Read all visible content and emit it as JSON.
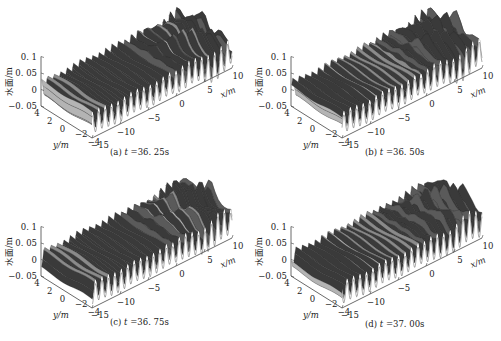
{
  "figure": {
    "panels": [
      {
        "id": "a",
        "letter": "(a)",
        "t_label": "t",
        "t_value": "=36. 25s",
        "left": 0,
        "top": 0,
        "seed": 1,
        "shift": 0.0
      },
      {
        "id": "b",
        "letter": "(b)",
        "t_label": "t",
        "t_value": "=36. 50s",
        "left": 250,
        "top": 0,
        "seed": 2,
        "shift": 0.25
      },
      {
        "id": "c",
        "letter": "(c)",
        "t_label": "t",
        "t_value": "=36. 75s",
        "left": 0,
        "top": 170,
        "seed": 3,
        "shift": 0.5
      },
      {
        "id": "d",
        "letter": "(d)",
        "t_label": "t",
        "t_value": "=37. 00s",
        "left": 250,
        "top": 170,
        "seed": 4,
        "shift": 0.75
      }
    ],
    "axes": {
      "z_label": "水面/m",
      "z_ticks": [
        "0. 1",
        "0. 05",
        "0",
        "−0. 05"
      ],
      "y_label": "y/m",
      "y_ticks": [
        "4",
        "2",
        "0",
        "−2",
        "−4"
      ],
      "x_label": "x/m",
      "x_ticks": [
        "−15",
        "−10",
        "−5",
        "0",
        "5",
        "10"
      ]
    },
    "colors": {
      "surface": "#8a8a8a",
      "surface_dark": "#3a3a3a",
      "surface_light": "#b4b4b4",
      "axis": "#444444",
      "text": "#222222"
    }
  },
  "chart_data": [
    {
      "type": "surface3d",
      "title": "(a) t=36.25s",
      "xlabel": "x/m",
      "ylabel": "y/m",
      "zlabel": "水面/m",
      "xlim": [
        -15,
        10
      ],
      "ylim": [
        -4,
        4
      ],
      "zlim": [
        -0.05,
        0.1
      ],
      "x_ticks": [
        -15,
        -10,
        -5,
        0,
        5,
        10
      ],
      "y_ticks": [
        4,
        2,
        0,
        -2,
        -4
      ],
      "z_ticks": [
        0.1,
        0.05,
        0,
        -0.05
      ],
      "description": "Regular long-crested waves (~0.03 m amplitude) for x < 0, transitioning to short-crested, amplified irregular waves (peaks up to ~0.1 m) for x from 0 to 10"
    },
    {
      "type": "surface3d",
      "title": "(b) t=36.50s",
      "xlabel": "x/m",
      "ylabel": "y/m",
      "zlabel": "水面/m",
      "xlim": [
        -15,
        10
      ],
      "ylim": [
        -4,
        4
      ],
      "zlim": [
        -0.05,
        0.1
      ],
      "x_ticks": [
        -15,
        -10,
        -5,
        0,
        5,
        10
      ],
      "y_ticks": [
        4,
        2,
        0,
        -2,
        -4
      ],
      "z_ticks": [
        0.1,
        0.05,
        0,
        -0.05
      ],
      "description": "Same wave field advanced by 0.25 s"
    },
    {
      "type": "surface3d",
      "title": "(c) t=36.75s",
      "xlabel": "x/m",
      "ylabel": "y/m",
      "zlabel": "水面/m",
      "xlim": [
        -15,
        10
      ],
      "ylim": [
        -4,
        4
      ],
      "zlim": [
        -0.05,
        0.1
      ],
      "x_ticks": [
        -15,
        -10,
        -5,
        0,
        5,
        10
      ],
      "y_ticks": [
        4,
        2,
        0,
        -2,
        -4
      ],
      "z_ticks": [
        0.1,
        0.05,
        0,
        -0.05
      ],
      "description": "Same wave field advanced by 0.5 s"
    },
    {
      "type": "surface3d",
      "title": "(d) t=37.00s",
      "xlabel": "x/m",
      "ylabel": "y/m",
      "zlabel": "水面/m",
      "xlim": [
        -15,
        10
      ],
      "ylim": [
        -4,
        4
      ],
      "zlim": [
        -0.05,
        0.1
      ],
      "x_ticks": [
        -15,
        -10,
        -5,
        0,
        5,
        10
      ],
      "y_ticks": [
        4,
        2,
        0,
        -2,
        -4
      ],
      "z_ticks": [
        0.1,
        0.05,
        0,
        -0.05
      ],
      "description": "Same wave field advanced by 0.75 s"
    }
  ]
}
